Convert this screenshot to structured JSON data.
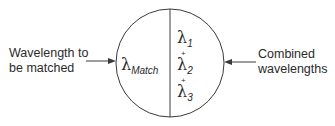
{
  "diagram": {
    "left_label": {
      "line1": "Wavelength to",
      "line2": "be matched"
    },
    "right_label": {
      "line1": "Combined",
      "line2": "wavelengths"
    },
    "left_half": {
      "symbol": "λ",
      "subscript": "Match"
    },
    "right_half": {
      "items": [
        {
          "symbol": "λ",
          "subscript": "1"
        },
        {
          "symbol": "λ",
          "subscript": "2"
        },
        {
          "symbol": "λ",
          "subscript": "3"
        }
      ],
      "separator": "+"
    },
    "colors": {
      "stroke": "#3a3a3a",
      "text": "#2a2a2a",
      "background": "#ffffff"
    }
  }
}
